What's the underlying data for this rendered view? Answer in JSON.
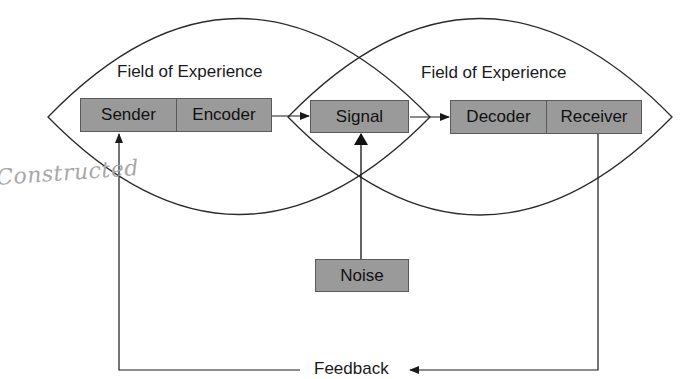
{
  "diagram": {
    "type": "communication-model",
    "fields": [
      {
        "label": "Field of Experience",
        "side": "sender"
      },
      {
        "label": "Field of Experience",
        "side": "receiver"
      }
    ],
    "nodes": {
      "sender": "Sender",
      "encoder": "Encoder",
      "signal": "Signal",
      "decoder": "Decoder",
      "receiver": "Receiver",
      "noise": "Noise"
    },
    "feedback_label": "Feedback",
    "handwritten_note": "Constructed",
    "colors": {
      "box_fill": "#9a9a9a",
      "box_border": "#5a5a5a",
      "line": "#2a2a2a",
      "handwriting": "#a8a8a8"
    },
    "edges": [
      {
        "from": "Encoder",
        "to": "Signal"
      },
      {
        "from": "Signal",
        "to": "Decoder"
      },
      {
        "from": "Noise",
        "to": "Signal"
      },
      {
        "from": "Receiver",
        "to": "Feedback"
      },
      {
        "from": "Feedback",
        "to": "Sender"
      }
    ]
  }
}
